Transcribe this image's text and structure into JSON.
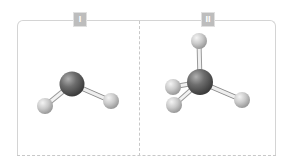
{
  "panels": [
    {
      "label": "I",
      "molecule": {
        "description": "bent triatomic ball-and-stick model",
        "center_atom": {
          "x": 72,
          "y": 84,
          "r": 12,
          "color": "#5a5a5a"
        },
        "outer_atoms": [
          {
            "x": 45,
            "y": 106,
            "r": 8
          },
          {
            "x": 111,
            "y": 101,
            "r": 8
          }
        ]
      }
    },
    {
      "label": "II",
      "molecule": {
        "description": "tetrahedral ball-and-stick model",
        "center_atom": {
          "x": 200,
          "y": 82,
          "r": 13,
          "color": "#5a5a5a"
        },
        "outer_atoms": [
          {
            "x": 199,
            "y": 41,
            "r": 8
          },
          {
            "x": 173,
            "y": 87,
            "r": 8
          },
          {
            "x": 174,
            "y": 105,
            "r": 8
          },
          {
            "x": 242,
            "y": 100,
            "r": 8
          }
        ]
      }
    }
  ],
  "colors": {
    "frame": "#d4d4d4",
    "label_bg": "#bdbdbd",
    "center_atom": "#5a5a5a",
    "outer_atom": "#d8d8d8",
    "bond": "#f2f2f2"
  }
}
